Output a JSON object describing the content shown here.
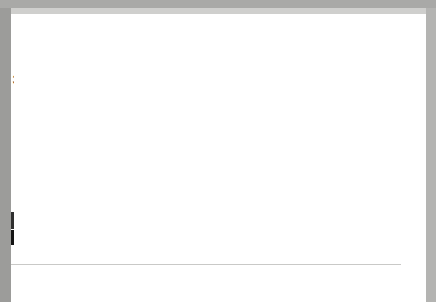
{
  "figure": {
    "banner_label": "FIGURE 9.1",
    "title_line1": "Percentage of Adults Aged 65 Years and Over Who Need Help with",
    "title_line2": "Personal Care, by Age Group and Sex, January–September 2003",
    "source_label": "SOURCE: Centers for Disease Control and Prevention. (2004b). ",
    "source_italic": "Early Release of Selected Estimates Based on Data from the"
  },
  "colors": {
    "banner_bg": "#8d8d8b",
    "title_text": "#6e6e6c",
    "bar_total": "#2f2f2f",
    "bar_men": "#8c8c8a",
    "bar_women": "#8c8c8a",
    "band_bg": "#141414",
    "band_text": "#ffffff",
    "frame": "#9c9c9a"
  },
  "chart_data": {
    "type": "bar",
    "title": "Percentage of Adults Aged 65 Years and Over Who Need Help with Personal Care, by Age Group and Sex, January–September 2003",
    "xlabel": "",
    "ylabel": "",
    "ylim": [
      0,
      28
    ],
    "grid": false,
    "legend_position": "none",
    "categories": [
      "65–74 YEARS",
      "75–84 YEARS",
      "85 YEARS AND OVER"
    ],
    "subcategories": [
      "Total",
      "Men",
      "Women"
    ],
    "series": [
      {
        "name": "Total",
        "values": [
          3.3,
          6.4,
          22.9
        ]
      },
      {
        "name": "Men",
        "values": [
          3.1,
          5.3,
          16.2
        ]
      },
      {
        "name": "Women",
        "values": [
          3.5,
          7.0,
          26.2
        ]
      }
    ],
    "groups": [
      {
        "band_label": "65–74 YEARS",
        "bars": [
          {
            "sex": "Total",
            "value": 3.3,
            "label": "3.3%"
          },
          {
            "sex": "Men",
            "value": 3.1,
            "label": "3.1%"
          },
          {
            "sex": "Women",
            "value": 3.5,
            "label": "3.5%"
          }
        ]
      },
      {
        "band_label": "75–84 YEARS",
        "bars": [
          {
            "sex": "Total",
            "value": 6.4,
            "label": "6.4%"
          },
          {
            "sex": "Men",
            "value": 5.3,
            "label": "5.3%"
          },
          {
            "sex": "Women",
            "value": 7.0,
            "label": "7%"
          }
        ]
      },
      {
        "band_label": "85 YEARS AND OVER",
        "bars": [
          {
            "sex": "Total",
            "value": 22.9,
            "label": "22.9%"
          },
          {
            "sex": "Men",
            "value": 16.2,
            "label": "16.2%"
          },
          {
            "sex": "Women",
            "value": 26.2,
            "label": "26.2%"
          }
        ]
      }
    ]
  }
}
